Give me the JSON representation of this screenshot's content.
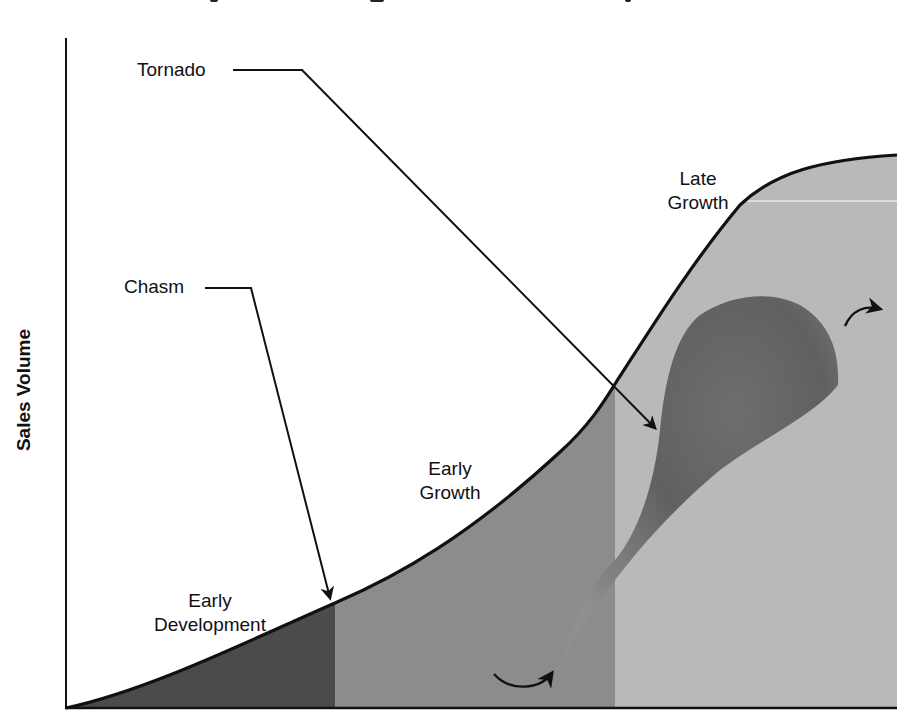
{
  "diagram": {
    "type": "technology-adoption-life-cycle",
    "y_axis_label": "Sales Volume",
    "x_axis_label": "",
    "phases": [
      {
        "id": "early-development",
        "label_line1": "Early",
        "label_line2": "Development",
        "fill": "#4b4b4b"
      },
      {
        "id": "early-growth",
        "label_line1": "Early",
        "label_line2": "Growth",
        "fill": "#8c8c8c"
      },
      {
        "id": "late-growth",
        "label_line1": "Late",
        "label_line2": "Growth",
        "fill": "#b9b9b9"
      }
    ],
    "callouts": [
      {
        "id": "tornado",
        "label": "Tornado"
      },
      {
        "id": "chasm",
        "label": "Chasm"
      }
    ],
    "colors": {
      "background": "#ffffff",
      "curve": "#111111",
      "tornado_dark": "#5a5a5a",
      "tornado_light": "#9a9a9a"
    }
  }
}
